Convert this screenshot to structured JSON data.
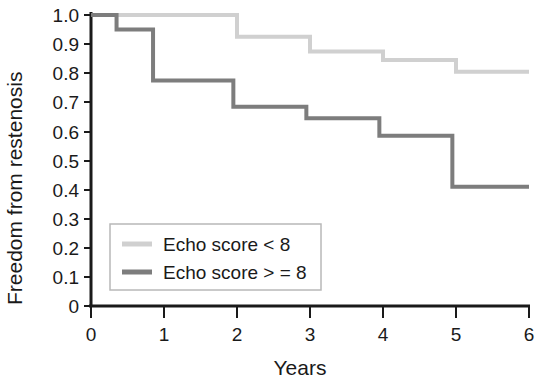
{
  "chart_data": {
    "type": "line",
    "subtype": "kaplan-meier-step",
    "title": "",
    "xlabel": "Years",
    "ylabel": "Freedom from restenosis",
    "xlim": [
      0,
      6
    ],
    "ylim": [
      0,
      1.0
    ],
    "xticks": [
      0,
      1,
      2,
      3,
      4,
      5,
      6
    ],
    "xtick_labels": [
      "0",
      "1",
      "2",
      "3",
      "4",
      "5",
      "6"
    ],
    "yticks": [
      0,
      0.1,
      0.2,
      0.3,
      0.4,
      0.5,
      0.6,
      0.7,
      0.8,
      0.9,
      1.0
    ],
    "ytick_labels": [
      "0",
      "0.1",
      "0.2",
      "0.3",
      "0.4",
      "0.5",
      "0.6",
      "0.7",
      "0.8",
      "0.9",
      "1.0"
    ],
    "grid": false,
    "legend_position": "lower-left-inside",
    "series": [
      {
        "name": "Echo score < 8",
        "color": "#d0d0d0",
        "steps": [
          {
            "x": 0.0,
            "y": 1.0
          },
          {
            "x": 2.0,
            "y": 1.0
          },
          {
            "x": 2.0,
            "y": 0.925
          },
          {
            "x": 3.0,
            "y": 0.925
          },
          {
            "x": 3.0,
            "y": 0.875
          },
          {
            "x": 4.0,
            "y": 0.875
          },
          {
            "x": 4.0,
            "y": 0.845
          },
          {
            "x": 5.0,
            "y": 0.845
          },
          {
            "x": 5.0,
            "y": 0.805
          },
          {
            "x": 6.0,
            "y": 0.805
          }
        ]
      },
      {
        "name": "Echo score > = 8",
        "color": "#7d7d7d",
        "steps": [
          {
            "x": 0.0,
            "y": 1.0
          },
          {
            "x": 0.35,
            "y": 1.0
          },
          {
            "x": 0.35,
            "y": 0.95
          },
          {
            "x": 0.85,
            "y": 0.95
          },
          {
            "x": 0.85,
            "y": 0.775
          },
          {
            "x": 1.95,
            "y": 0.775
          },
          {
            "x": 1.95,
            "y": 0.685
          },
          {
            "x": 2.95,
            "y": 0.685
          },
          {
            "x": 2.95,
            "y": 0.645
          },
          {
            "x": 3.95,
            "y": 0.645
          },
          {
            "x": 3.95,
            "y": 0.585
          },
          {
            "x": 4.95,
            "y": 0.585
          },
          {
            "x": 4.95,
            "y": 0.41
          },
          {
            "x": 6.0,
            "y": 0.41
          }
        ]
      }
    ]
  },
  "legend": {
    "items": [
      {
        "label": "Echo score < 8",
        "color": "#d0d0d0"
      },
      {
        "label": "Echo score > = 8",
        "color": "#7d7d7d"
      }
    ]
  },
  "axes": {
    "y_title": "Freedom from restenosis",
    "x_title": "Years",
    "axis_color": "#1a1a1a"
  }
}
